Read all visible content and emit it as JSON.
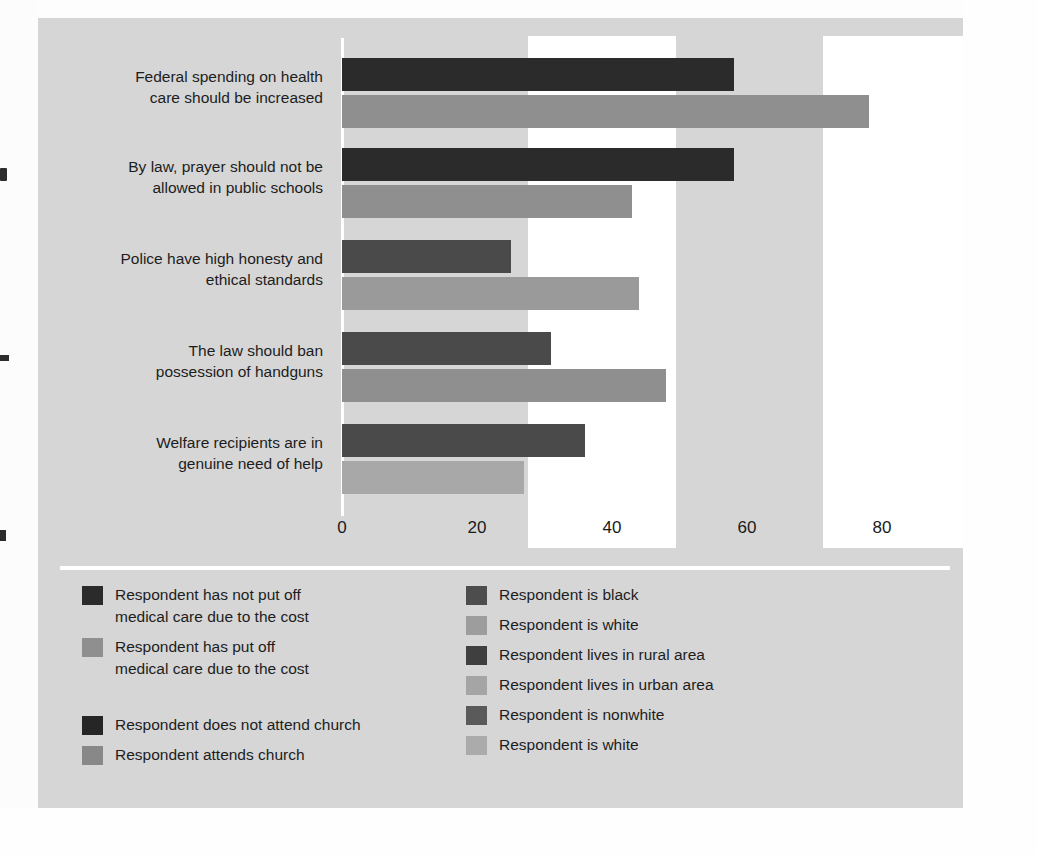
{
  "chart_data": {
    "type": "bar",
    "orientation": "horizontal",
    "title": "",
    "subtitle": "",
    "xlabel": "",
    "ylabel": "",
    "xlim": [
      0,
      85
    ],
    "xticks": [
      "0",
      "20",
      "40",
      "60",
      "80"
    ],
    "xtick_values": [
      0,
      20,
      40,
      60,
      80
    ],
    "grid": false,
    "legend_position": "below-plot-two-columns",
    "categories": [
      "Federal spending on health\ncare should be increased",
      "By law, prayer should not be\nallowed in public schools",
      "Police have high honesty and\nethical standards",
      "The law should ban\npossession of handguns",
      "Welfare recipients are in\ngenuine need of help"
    ],
    "series": [
      {
        "name": "dark",
        "values": [
          58,
          58,
          25,
          31,
          36
        ],
        "colors": [
          "#2b2b2b",
          "#2b2b2b",
          "#4a4a4a",
          "#4a4a4a",
          "#4a4a4a"
        ]
      },
      {
        "name": "light",
        "values": [
          78,
          43,
          44,
          48,
          27
        ],
        "colors": [
          "#8f8f8f",
          "#8f8f8f",
          "#9a9a9a",
          "#8f8f8f",
          "#a8a8a8"
        ]
      }
    ]
  },
  "axis": {
    "ticks": [
      {
        "label": "0",
        "value": 0
      },
      {
        "label": "20",
        "value": 20
      },
      {
        "label": "40",
        "value": 40
      },
      {
        "label": "60",
        "value": 60
      },
      {
        "label": "80",
        "value": 80
      }
    ]
  },
  "categories": [
    {
      "line1": "Federal spending on health",
      "line2": "care should be increased"
    },
    {
      "line1": "By law, prayer should not be",
      "line2": "allowed in public schools"
    },
    {
      "line1": "Police have high honesty and",
      "line2": "ethical standards"
    },
    {
      "line1": "The law should ban",
      "line2": "possession of handguns"
    },
    {
      "line1": "Welfare recipients are in",
      "line2": "genuine need of help"
    }
  ],
  "legend": {
    "left_column": [
      {
        "label": "Respondent has not put off\nmedical care due to the cost",
        "color": "#2b2b2b"
      },
      {
        "label": "Respondent has put off\nmedical care due to the cost",
        "color": "#8f8f8f"
      },
      {
        "label": "Respondent does not attend church",
        "color": "#262626"
      },
      {
        "label": "Respondent attends church",
        "color": "#888888"
      }
    ],
    "right_column": [
      {
        "label": "Respondent is black",
        "color": "#4d4d4d"
      },
      {
        "label": "Respondent is white",
        "color": "#9d9d9d"
      },
      {
        "label": "Respondent lives in rural area",
        "color": "#3f3f3f"
      },
      {
        "label": "Respondent lives in urban area",
        "color": "#a5a5a5"
      },
      {
        "label": "Respondent is nonwhite",
        "color": "#5a5a5a"
      },
      {
        "label": "Respondent is white",
        "color": "#ababab"
      }
    ]
  },
  "colors": {
    "panel_background": "#d6d6d6",
    "page_background": "#fdfdfd",
    "scan_band": "#ffffff",
    "text": "#1d1d1d",
    "axis_line": "#ffffff"
  }
}
